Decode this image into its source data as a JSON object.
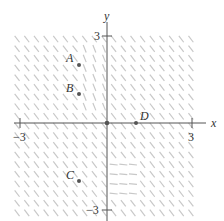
{
  "figure": {
    "type": "slope_field",
    "axes": {
      "x_label": "x",
      "y_label": "y",
      "x_ticks": [
        {
          "value": -3,
          "label": "−3"
        },
        {
          "value": 3,
          "label": "3"
        }
      ],
      "y_ticks": [
        {
          "value": 3,
          "label": "3"
        },
        {
          "value": -3,
          "label": "−3"
        }
      ],
      "xlim": [
        -3.3,
        3.3
      ],
      "ylim": [
        -3.3,
        3.3
      ]
    },
    "points": [
      {
        "name": "A",
        "x": -1,
        "y": 2
      },
      {
        "name": "B",
        "x": -1,
        "y": 1
      },
      {
        "name": "C",
        "x": -1,
        "y": -2
      },
      {
        "name": "D",
        "x": 1,
        "y": 0
      },
      {
        "name": "",
        "x": 0,
        "y": 0
      }
    ],
    "field": {
      "spacing": 0.333,
      "default_slope": -1.3,
      "regions": [
        {
          "x": [
            0.0,
            1.0
          ],
          "y": [
            -2.6,
            -1.2
          ],
          "slope": -0.1
        },
        {
          "x": [
            -1.0,
            0.0
          ],
          "y": [
            0.5,
            2.8
          ],
          "slope": -2.5
        }
      ],
      "color": "#c8c8c8"
    },
    "colors": {
      "axis": "#555555",
      "point": "#555555",
      "text": "#333333"
    }
  }
}
